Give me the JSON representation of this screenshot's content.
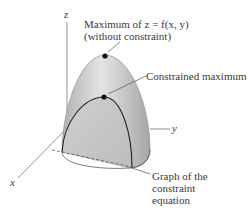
{
  "axes": {
    "x": "x",
    "y": "y",
    "z": "z"
  },
  "annotations": {
    "max_unconstrained_line1": "Maximum of z = f(x, y)",
    "max_unconstrained_line2": "(without constraint)",
    "constrained_max": "Constrained maximum",
    "constraint_line1": "Graph of the",
    "constraint_line2": "constraint",
    "constraint_line3": "equation"
  },
  "colors": {
    "surface_light": "#e6e6e6",
    "surface_dark": "#a8a8a8",
    "curve": "#222222",
    "axis": "#666666"
  }
}
